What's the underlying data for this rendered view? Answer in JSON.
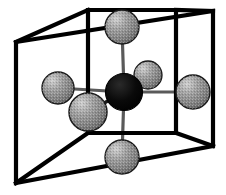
{
  "figure": {
    "background_color": "#ffffff",
    "width": 226,
    "height": 195
  },
  "colors": {
    "cube_edge": "#000000",
    "bond": "#5a5a5a",
    "central_atom_fill": "#000000",
    "ligand_atom_fill": "#8e8e8e",
    "ligand_atom_highlight": "#c9c9c9",
    "ligand_atom_shadow": "#5e5e5e",
    "ligand_atom_outline": "#1a1a1a"
  },
  "cube": {
    "label": "cubic unit cell",
    "edge_width": 4.2,
    "back_face": {
      "label": "back square face",
      "top_left": [
        16,
        42
      ],
      "top_right": [
        213,
        11
      ],
      "bottom_right": [
        213,
        146
      ],
      "bottom_left": [
        16,
        183
      ]
    },
    "front_face": {
      "label": "front square face",
      "top_left": [
        88,
        10
      ],
      "top_right": [
        176,
        10
      ],
      "bottom_right": [
        176,
        133
      ],
      "bottom_left": [
        88,
        133
      ]
    },
    "connectors": [
      {
        "label": "top-left-connector",
        "from": [
          16,
          42
        ],
        "to": [
          88,
          10
        ]
      },
      {
        "label": "top-right-connector",
        "from": [
          213,
          11
        ],
        "to": [
          176,
          10
        ]
      },
      {
        "label": "bottom-right-connector",
        "from": [
          213,
          146
        ],
        "to": [
          176,
          133
        ]
      },
      {
        "label": "bottom-left-connector",
        "from": [
          16,
          183
        ],
        "to": [
          88,
          133
        ]
      }
    ]
  },
  "bonds": {
    "label": "coordination bonds",
    "stroke_width": 3.2,
    "items": [
      {
        "label": "bond-to-top-ligand",
        "from": [
          124,
          92
        ],
        "to": [
          122,
          27
        ]
      },
      {
        "label": "bond-to-bottom-ligand",
        "from": [
          124,
          92
        ],
        "to": [
          122,
          157
        ]
      },
      {
        "label": "bond-to-left-ligand",
        "from": [
          124,
          92
        ],
        "to": [
          58,
          88
        ]
      },
      {
        "label": "bond-to-right-ligand",
        "from": [
          124,
          92
        ],
        "to": [
          193,
          92
        ]
      },
      {
        "label": "bond-to-front-ligand",
        "from": [
          124,
          92
        ],
        "to": [
          88,
          112
        ]
      },
      {
        "label": "bond-to-back-ligand",
        "from": [
          124,
          92
        ],
        "to": [
          148,
          75
        ]
      }
    ]
  },
  "atoms": [
    {
      "id": "central-atom",
      "label": "central cation",
      "type": "central",
      "cx": 124,
      "cy": 92,
      "r": 18.5,
      "fill": "#000000"
    },
    {
      "id": "ligand-top",
      "label": "top ligand atom",
      "type": "ligand",
      "cx": 122,
      "cy": 27,
      "r": 17,
      "fill": "#8e8e8e"
    },
    {
      "id": "ligand-bottom",
      "label": "bottom ligand atom",
      "type": "ligand",
      "cx": 122,
      "cy": 157,
      "r": 17,
      "fill": "#8e8e8e"
    },
    {
      "id": "ligand-left",
      "label": "left ligand atom",
      "type": "ligand",
      "cx": 58,
      "cy": 88,
      "r": 16,
      "fill": "#8e8e8e"
    },
    {
      "id": "ligand-right",
      "label": "right ligand atom",
      "type": "ligand",
      "cx": 193,
      "cy": 92,
      "r": 17,
      "fill": "#8e8e8e"
    },
    {
      "id": "ligand-front",
      "label": "front lower-left ligand atom",
      "type": "ligand",
      "cx": 88,
      "cy": 112,
      "r": 19,
      "fill": "#8e8e8e"
    },
    {
      "id": "ligand-back",
      "label": "back upper-right ligand atom",
      "type": "ligand",
      "cx": 148,
      "cy": 75,
      "r": 14,
      "fill": "#8e8e8e"
    }
  ]
}
